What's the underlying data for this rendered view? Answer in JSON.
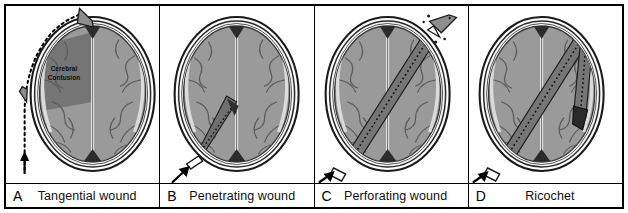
{
  "figure": {
    "background_color": "#ffffff",
    "border_color": "#000000",
    "panel_count": 4
  },
  "palette": {
    "skull_outer_line": "#1a1a1a",
    "scalp_fill": "#ffffff",
    "bone_fill": "#f2f2f2",
    "dura_line": "#4a4a4a",
    "brain_fill": "#9a9a9a",
    "brain_fill_dark": "#7d7d7d",
    "sulci_line": "#6a6a6a",
    "falx_line": "#e8e8e8",
    "contusion_fill": "#6e6e6e",
    "bullet_fill": "#8a8a8a",
    "bullet_dark": "#3a3a3a",
    "track_fill": "#7a7a7a",
    "notch_dark": "#2b2b2b",
    "arrow_color": "#000000",
    "caption_text": "#111111"
  },
  "panels": [
    {
      "letter": "A",
      "caption": "Tangential wound",
      "annotation": "Cerebral\nContusion",
      "annotation_line1": "Cerebral",
      "annotation_line2": "Contusion",
      "trajectory": "tangential",
      "trajectory_description": "Bullet grazes the outer skull along a curved dotted path, deflecting away without entering the cranial vault; underlying brain shows a cerebral contusion.",
      "bullet_count": 2,
      "has_entry_arrow": true,
      "has_exit": false,
      "has_fragments": false
    },
    {
      "letter": "B",
      "caption": "Penetrating wound",
      "annotation": "",
      "annotation_line1": "",
      "annotation_line2": "",
      "trajectory": "penetrating",
      "trajectory_description": "Bullet enters the skull at the left posterior region and comes to rest within the brain; no exit wound.",
      "bullet_count": 1,
      "has_entry_arrow": true,
      "has_exit": false,
      "has_fragments": false
    },
    {
      "letter": "C",
      "caption": "Perforating wound",
      "annotation": "",
      "annotation_line1": "",
      "annotation_line2": "",
      "trajectory": "perforating",
      "trajectory_description": "Bullet passes completely through the head, creating an entrance at the lower left and an exit at the upper right with bone fragments.",
      "bullet_count": 1,
      "has_entry_arrow": true,
      "has_exit": true,
      "has_fragments": true
    },
    {
      "letter": "D",
      "caption": "Ricochet",
      "annotation": "",
      "annotation_line1": "",
      "annotation_line2": "",
      "trajectory": "ricochet",
      "trajectory_description": "Bullet enters at the lower left, strikes the inner table of the skull at the upper right, deflects and travels back along a second track, coming to rest laterally.",
      "bullet_count": 1,
      "has_entry_arrow": true,
      "has_exit": false,
      "has_fragments": false
    }
  ]
}
